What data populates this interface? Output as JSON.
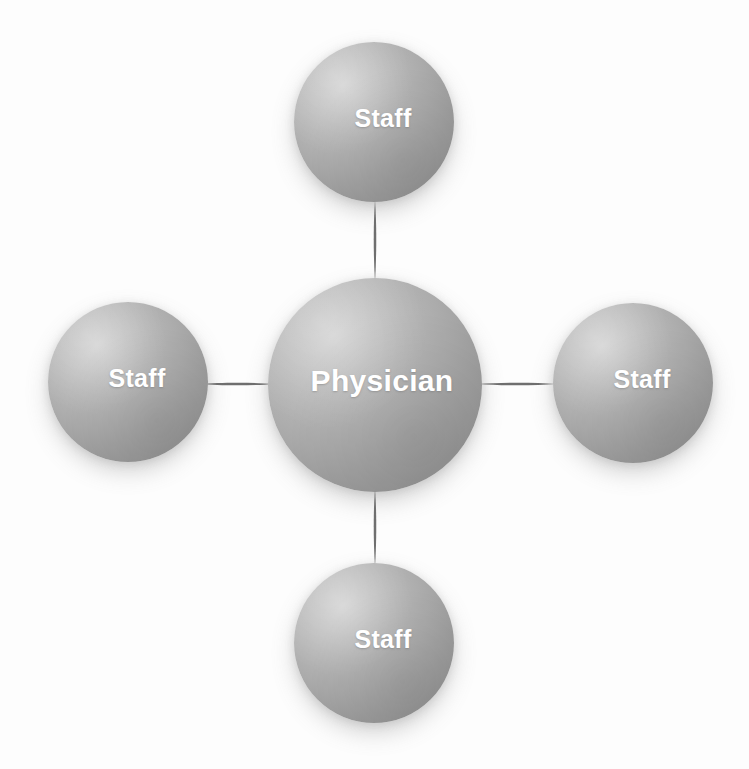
{
  "diagram": {
    "type": "hub-and-spoke",
    "colors": {
      "background": "#fdfdfd",
      "sphere_highlight": "#d2d2d2",
      "sphere_midtone": "#ababab",
      "sphere_shadow": "#8a8a8a",
      "label_text": "#ffffff",
      "connector": "#6f6f6f"
    },
    "center_node": {
      "id": "physician",
      "label": "Physician",
      "shape": "sphere",
      "diameter_px": 214,
      "center_x": 375,
      "center_y": 385
    },
    "outer_nodes": [
      {
        "id": "staff-top",
        "label": "Staff",
        "position": "top",
        "shape": "sphere",
        "diameter_px": 160,
        "center_x": 374,
        "center_y": 122
      },
      {
        "id": "staff-left",
        "label": "Staff",
        "position": "left",
        "shape": "sphere",
        "diameter_px": 160,
        "center_x": 128,
        "center_y": 382
      },
      {
        "id": "staff-right",
        "label": "Staff",
        "position": "right",
        "shape": "sphere",
        "diameter_px": 160,
        "center_x": 633,
        "center_y": 383
      },
      {
        "id": "staff-bottom",
        "label": "Staff",
        "position": "bottom",
        "shape": "sphere",
        "diameter_px": 160,
        "center_x": 374,
        "center_y": 643
      }
    ],
    "connectors": [
      {
        "id": "connector-top",
        "from": "physician",
        "to": "staff-top",
        "style": "lens"
      },
      {
        "id": "connector-left",
        "from": "physician",
        "to": "staff-left",
        "style": "lens"
      },
      {
        "id": "connector-right",
        "from": "physician",
        "to": "staff-right",
        "style": "lens"
      },
      {
        "id": "connector-bottom",
        "from": "physician",
        "to": "staff-bottom",
        "style": "lens"
      }
    ]
  }
}
